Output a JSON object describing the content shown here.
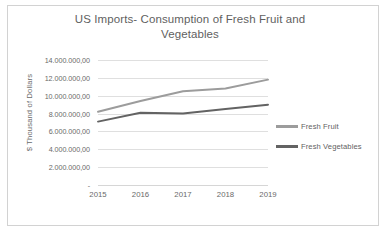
{
  "chart_data": {
    "type": "line",
    "title": "US Imports- Consumption of Fresh Fruit and Vegetables",
    "title_line1": "US Imports- Consumption of Fresh Fruit and",
    "title_line2": "Vegetables",
    "xlabel": "",
    "ylabel": "$ Thousand of Dollars",
    "categories": [
      "2015",
      "2016",
      "2017",
      "2018",
      "2019"
    ],
    "x": [
      2015,
      2016,
      2017,
      2018,
      2019
    ],
    "ylim": [
      0,
      14000000
    ],
    "ytick_values": [
      0,
      2000000,
      4000000,
      6000000,
      8000000,
      10000000,
      12000000,
      14000000
    ],
    "ytick_labels": [
      "-",
      "2.000.000,00",
      "4.000.000,00",
      "6.000.000,00",
      "8.000.000,00",
      "10.000.000,00",
      "12.000.000,00",
      "14.000.000,00"
    ],
    "grid": true,
    "grid_axis": "y",
    "legend_position": "right",
    "series": [
      {
        "name": "Fresh Fruit",
        "color": "#9c9c9c",
        "values": [
          8200000,
          9400000,
          10500000,
          10800000,
          11800000
        ]
      },
      {
        "name": "Fresh Vegetables",
        "color": "#636363",
        "values": [
          7100000,
          8100000,
          8000000,
          8500000,
          9000000
        ]
      }
    ]
  },
  "colors": {
    "title_text": "#5f5f5f",
    "axis_text": "#6a6a6a",
    "gridline": "#dfdfdf",
    "frame_border": "#d2d2d2",
    "background": "#ffffff"
  }
}
